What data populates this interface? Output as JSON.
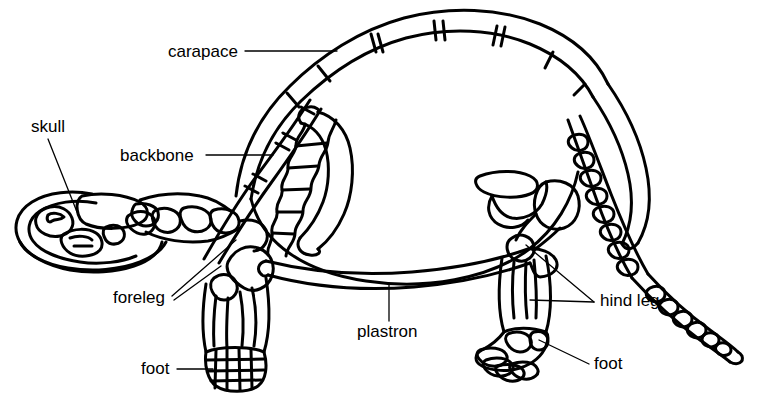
{
  "figure": {
    "background_color": "#ffffff",
    "line_color": "#000000",
    "text_color": "#000000"
  },
  "labels": [
    {
      "id": "carapace",
      "text": "carapace",
      "x": 168,
      "y": 43,
      "leader": "horizontal-right",
      "anchor_x": 245,
      "anchor_y": 51,
      "target_x": 337,
      "target_y": 51
    },
    {
      "id": "skull",
      "text": "skull",
      "x": 31,
      "y": 118,
      "leader": "diagonal-down-right",
      "anchor_x": 48,
      "anchor_y": 139,
      "target_x": 77,
      "target_y": 212
    },
    {
      "id": "backbone",
      "text": "backbone",
      "x": 120,
      "y": 147,
      "leader": "horizontal-right",
      "anchor_x": 206,
      "anchor_y": 155,
      "target_x": 273,
      "target_y": 155
    },
    {
      "id": "foreleg",
      "text": "foreleg",
      "x": 113,
      "y": 291,
      "leader": "diagonal-up-right",
      "anchor_x": 172,
      "anchor_y": 296,
      "target_x": 236,
      "target_y": 240
    },
    {
      "id": "foot-front",
      "text": "foot",
      "x": 141,
      "y": 361,
      "leader": "horizontal-right",
      "anchor_x": 177,
      "anchor_y": 369,
      "target_x": 213,
      "target_y": 369
    },
    {
      "id": "plastron",
      "text": "plastron",
      "x": 357,
      "y": 325,
      "leader": "vertical-up",
      "anchor_x": 389,
      "anchor_y": 321,
      "target_x": 389,
      "target_y": 283
    },
    {
      "id": "hind-leg",
      "text": "hind leg",
      "x": 600,
      "y": 294,
      "leader": "double-fork-left",
      "anchor_x": 594,
      "anchor_y": 302,
      "target_x": 526,
      "target_y": 245
    },
    {
      "id": "foot-hind",
      "text": "foot",
      "x": 594,
      "y": 356,
      "leader": "diagonal-up-left",
      "anchor_x": 589,
      "anchor_y": 364,
      "target_x": 539,
      "target_y": 340
    }
  ],
  "anatomy_parts": [
    "carapace",
    "skull",
    "backbone",
    "foreleg",
    "foot",
    "plastron",
    "hind leg",
    "tail"
  ]
}
